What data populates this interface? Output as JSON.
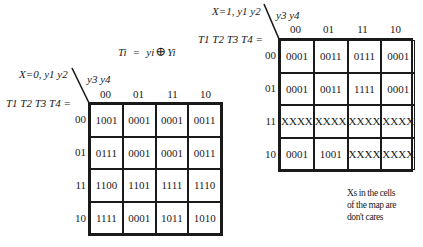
{
  "equation": {
    "lhs": "Ti",
    "equals": "=",
    "term1": "yi",
    "operator_symbol": "⊕",
    "term2": "Yi"
  },
  "maps": [
    {
      "id": "x0",
      "condition_label": "X=0,  y1 y2",
      "col_var_label": "y3 y4",
      "output_label": "T1 T2 T3 T4 =",
      "col_headers": [
        "00",
        "01",
        "11",
        "10"
      ],
      "row_headers": [
        "00",
        "01",
        "11",
        "10"
      ],
      "cells": [
        [
          "1001",
          "0001",
          "0001",
          "0011"
        ],
        [
          "0111",
          "0001",
          "0001",
          "0011"
        ],
        [
          "1100",
          "1101",
          "1111",
          "1110"
        ],
        [
          "1111",
          "0001",
          "1011",
          "1010"
        ]
      ]
    },
    {
      "id": "x1",
      "condition_label": "X=1, y1 y2",
      "col_var_label": "y3 y4",
      "output_label": "T1 T2 T3 T4 =",
      "col_headers": [
        "00",
        "01",
        "11",
        "10"
      ],
      "row_headers": [
        "00",
        "01",
        "11",
        "10"
      ],
      "cells": [
        [
          "0001",
          "0011",
          "0111",
          "0001"
        ],
        [
          "0001",
          "0011",
          "1111",
          "0001"
        ],
        [
          "XXXX",
          "XXXX",
          "XXXX",
          "XXXX"
        ],
        [
          "0001",
          "1001",
          "XXXX",
          "XXXX"
        ]
      ]
    }
  ],
  "note": {
    "lines": [
      "Xs in the cells",
      "of the map are",
      "don't cares"
    ]
  },
  "colors": {
    "ink": "#1a1a1a",
    "background": "#ffffff"
  }
}
